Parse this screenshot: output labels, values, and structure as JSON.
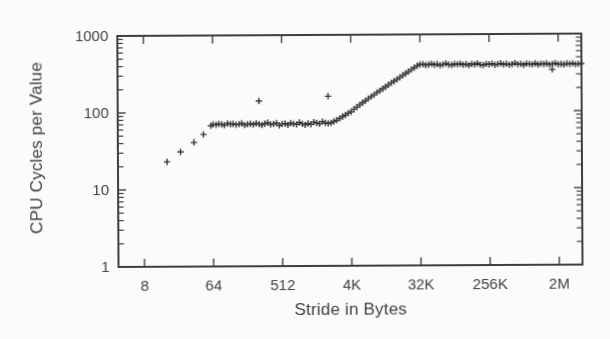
{
  "figure": {
    "background": "#fcfbf9",
    "ink": "#3f3f3f",
    "marker_color": "#343434",
    "text_color": "#414141"
  },
  "chart_data": {
    "type": "scatter",
    "marker": "+",
    "title": "",
    "xlabel": "Stride in Bytes",
    "ylabel": "CPU Cycles per Value",
    "x_scale": "log",
    "y_scale": "log",
    "xlim": [
      3.65,
      4220000
    ],
    "ylim": [
      1,
      1000
    ],
    "grid": false,
    "legend": "none",
    "x_ticks": [
      {
        "value": 8,
        "label": "8"
      },
      {
        "value": 64,
        "label": "64"
      },
      {
        "value": 512,
        "label": "512"
      },
      {
        "value": 4096,
        "label": "4K"
      },
      {
        "value": 32768,
        "label": "32K"
      },
      {
        "value": 262144,
        "label": "256K"
      },
      {
        "value": 2097152,
        "label": "2M"
      }
    ],
    "y_ticks": [
      {
        "value": 1,
        "label": "1"
      },
      {
        "value": 10,
        "label": "10"
      },
      {
        "value": 100,
        "label": "100"
      },
      {
        "value": 1000,
        "label": "1000"
      }
    ],
    "y_minor_mantissas": [
      2,
      3,
      4,
      5,
      6,
      7,
      8,
      9
    ],
    "series": [
      {
        "name": "cpu-cycles-per-value-vs-stride",
        "marker": "+",
        "points": [
          [
            16,
            23
          ],
          [
            24,
            31
          ],
          [
            36,
            41
          ],
          [
            48,
            52
          ],
          [
            60,
            67
          ],
          [
            64,
            70
          ],
          [
            70,
            69
          ],
          [
            76,
            71
          ],
          [
            83,
            70
          ],
          [
            90,
            68
          ],
          [
            99,
            72
          ],
          [
            108,
            70
          ],
          [
            117,
            71
          ],
          [
            128,
            69
          ],
          [
            140,
            70
          ],
          [
            152,
            72
          ],
          [
            166,
            68
          ],
          [
            181,
            70
          ],
          [
            197,
            71
          ],
          [
            215,
            69
          ],
          [
            235,
            72
          ],
          [
            256,
            70
          ],
          [
            279,
            68
          ],
          [
            304,
            71
          ],
          [
            332,
            73
          ],
          [
            362,
            69
          ],
          [
            395,
            70
          ],
          [
            431,
            72
          ],
          [
            470,
            67
          ],
          [
            512,
            70
          ],
          [
            558,
            71
          ],
          [
            609,
            68
          ],
          [
            664,
            72
          ],
          [
            724,
            70
          ],
          [
            790,
            69
          ],
          [
            861,
            73
          ],
          [
            939,
            70
          ],
          [
            1024,
            68
          ],
          [
            1117,
            71
          ],
          [
            1218,
            69
          ],
          [
            1328,
            74
          ],
          [
            1448,
            72
          ],
          [
            1579,
            70
          ],
          [
            1722,
            75
          ],
          [
            1878,
            72
          ],
          [
            2048,
            71
          ],
          [
            2234,
            72
          ],
          [
            2435,
            75
          ],
          [
            2656,
            78
          ],
          [
            2896,
            82
          ],
          [
            3158,
            87
          ],
          [
            3444,
            91
          ],
          [
            3757,
            96
          ],
          [
            4096,
            100
          ],
          [
            4467,
            108
          ],
          [
            4871,
            115
          ],
          [
            5312,
            123
          ],
          [
            5793,
            131
          ],
          [
            6317,
            139
          ],
          [
            6889,
            148
          ],
          [
            7513,
            157
          ],
          [
            8192,
            166
          ],
          [
            8934,
            177
          ],
          [
            9742,
            187
          ],
          [
            10624,
            198
          ],
          [
            11585,
            210
          ],
          [
            12634,
            222
          ],
          [
            13777,
            235
          ],
          [
            15027,
            249
          ],
          [
            16384,
            262
          ],
          [
            17867,
            278
          ],
          [
            19484,
            295
          ],
          [
            21247,
            312
          ],
          [
            23170,
            330
          ],
          [
            25268,
            350
          ],
          [
            27554,
            371
          ],
          [
            30054,
            392
          ],
          [
            32768,
            408
          ],
          [
            35734,
            412
          ],
          [
            38968,
            398
          ],
          [
            42495,
            405
          ],
          [
            46341,
            415
          ],
          [
            50535,
            402
          ],
          [
            55109,
            410
          ],
          [
            60107,
            396
          ],
          [
            65536,
            407
          ],
          [
            71468,
            418
          ],
          [
            77936,
            403
          ],
          [
            84990,
            399
          ],
          [
            92682,
            411
          ],
          [
            101070,
            406
          ],
          [
            110218,
            414
          ],
          [
            120214,
            400
          ],
          [
            131072,
            408
          ],
          [
            142936,
            395
          ],
          [
            155872,
            412
          ],
          [
            169980,
            405
          ],
          [
            185364,
            417
          ],
          [
            202141,
            401
          ],
          [
            220436,
            396
          ],
          [
            240428,
            409
          ],
          [
            262144,
            404
          ],
          [
            285873,
            413
          ],
          [
            311744,
            398
          ],
          [
            339959,
            407
          ],
          [
            370728,
            416
          ],
          [
            404281,
            402
          ],
          [
            440872,
            410
          ],
          [
            480856,
            397
          ],
          [
            524288,
            405
          ],
          [
            571746,
            419
          ],
          [
            623487,
            403
          ],
          [
            679918,
            408
          ],
          [
            741455,
            396
          ],
          [
            808562,
            411
          ],
          [
            881744,
            406
          ],
          [
            961712,
            400
          ],
          [
            1048576,
            414
          ],
          [
            1143492,
            399
          ],
          [
            1246974,
            409
          ],
          [
            1359836,
            404
          ],
          [
            1482910,
            412
          ],
          [
            1617124,
            397
          ],
          [
            1763488,
            407
          ],
          [
            1923425,
            415
          ],
          [
            2097152,
            401
          ],
          [
            2286983,
            405
          ],
          [
            2493948,
            398
          ],
          [
            2719672,
            410
          ],
          [
            2965821,
            403
          ],
          [
            3234249,
            413
          ],
          [
            3526975,
            400
          ],
          [
            3846850,
            406
          ],
          [
            4194304,
            408
          ],
          [
            256,
            140
          ],
          [
            2048,
            160
          ],
          [
            1750000,
            345
          ]
        ]
      }
    ]
  }
}
